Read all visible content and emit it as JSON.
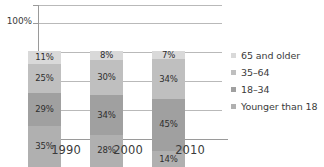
{
  "chart_data": {
    "type": "bar",
    "subtype": "stacked-100-percent",
    "title": "",
    "xlabel": "",
    "ylabel": "",
    "categories": [
      "1990",
      "2000",
      "2010"
    ],
    "ylim": [
      0,
      100
    ],
    "ytick_labels": [
      "100%"
    ],
    "grid": true,
    "gridline_count": 5,
    "legend_position": "right",
    "orientation": "vertical",
    "stack_order_bottom_to_top": [
      "Younger than 18",
      "18–34",
      "35–64",
      "65 and older"
    ],
    "series": [
      {
        "name": "65 and older",
        "color": "#d9d9d9",
        "values": [
          11,
          8,
          7
        ],
        "labels": [
          "11%",
          "8%",
          "7%"
        ]
      },
      {
        "name": "35–64",
        "color": "#bfbfbf",
        "values": [
          25,
          30,
          34
        ],
        "labels": [
          "25%",
          "30%",
          "34%"
        ]
      },
      {
        "name": "18–34",
        "color": "#a0a0a0",
        "values": [
          29,
          34,
          45
        ],
        "labels": [
          "29%",
          "34%",
          "45%"
        ]
      },
      {
        "name": "Younger than 18",
        "color": "#b0b0b0",
        "values": [
          35,
          28,
          14
        ],
        "labels": [
          "35%",
          "28%",
          "14%"
        ]
      }
    ]
  },
  "axis": {
    "y_top_label": "100%"
  },
  "legend": {
    "items": [
      {
        "label": "65 and older",
        "color": "#d9d9d9"
      },
      {
        "label": "35–64",
        "color": "#bfbfbf"
      },
      {
        "label": "18–34",
        "color": "#a0a0a0"
      },
      {
        "label": "Younger than 18",
        "color": "#b0b0b0"
      }
    ]
  },
  "xaxis": {
    "ticks": [
      "1990",
      "2000",
      "2010"
    ]
  },
  "bars": [
    {
      "category": "1990",
      "segments": [
        {
          "name": "65 and older",
          "label": "11%",
          "value": 11,
          "color": "#d9d9d9"
        },
        {
          "name": "35–64",
          "label": "25%",
          "value": 25,
          "color": "#bfbfbf"
        },
        {
          "name": "18–34",
          "label": "29%",
          "value": 29,
          "color": "#a0a0a0"
        },
        {
          "name": "Younger than 18",
          "label": "35%",
          "value": 35,
          "color": "#b0b0b0"
        }
      ]
    },
    {
      "category": "2000",
      "segments": [
        {
          "name": "65 and older",
          "label": "8%",
          "value": 8,
          "color": "#d9d9d9"
        },
        {
          "name": "35–64",
          "label": "30%",
          "value": 30,
          "color": "#bfbfbf"
        },
        {
          "name": "18–34",
          "label": "34%",
          "value": 34,
          "color": "#a0a0a0"
        },
        {
          "name": "Younger than 18",
          "label": "28%",
          "value": 28,
          "color": "#b0b0b0"
        }
      ]
    },
    {
      "category": "2010",
      "segments": [
        {
          "name": "65 and older",
          "label": "7%",
          "value": 7,
          "color": "#d9d9d9"
        },
        {
          "name": "35–64",
          "label": "34%",
          "value": 34,
          "color": "#bfbfbf"
        },
        {
          "name": "18–34",
          "label": "45%",
          "value": 45,
          "color": "#a0a0a0"
        },
        {
          "name": "Younger than 18",
          "label": "14%",
          "value": 14,
          "color": "#b0b0b0"
        }
      ]
    }
  ]
}
